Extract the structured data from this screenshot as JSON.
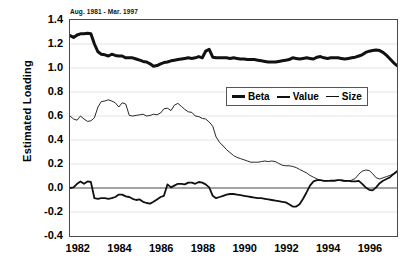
{
  "chart_data": {
    "type": "line",
    "title": "",
    "subtitle": "Aug. 1981 - Mar. 1997",
    "xlabel": "",
    "ylabel": "Estimated Loading",
    "xlim": [
      1981.58,
      1997.25
    ],
    "ylim": [
      -0.4,
      1.4
    ],
    "ytick_labels": [
      "1.4",
      "1.2",
      "1.0",
      "0.8",
      "0.6",
      "0.4",
      "0.2",
      "0.0",
      "-0.2",
      "-0.4"
    ],
    "ytick_values": [
      1.4,
      1.2,
      1.0,
      0.8,
      0.6,
      0.4,
      0.2,
      0.0,
      -0.2,
      -0.4
    ],
    "xtick_labels": [
      "1982",
      "1984",
      "1986",
      "1988",
      "1990",
      "1992",
      "1994",
      "1996"
    ],
    "xtick_values": [
      1982,
      1984,
      1986,
      1988,
      1990,
      1992,
      1994,
      1996
    ],
    "grid": "horizontal",
    "zero_line": true,
    "legend_position": "upper-center",
    "legend": [
      "Beta",
      "Value",
      "Size"
    ],
    "x": [
      1981.58,
      1981.75,
      1981.92,
      1982.08,
      1982.25,
      1982.42,
      1982.58,
      1982.75,
      1982.92,
      1983.08,
      1983.25,
      1983.42,
      1983.58,
      1983.75,
      1983.92,
      1984.08,
      1984.25,
      1984.42,
      1984.58,
      1984.75,
      1984.92,
      1985.08,
      1985.25,
      1985.42,
      1985.58,
      1985.75,
      1985.92,
      1986.08,
      1986.25,
      1986.42,
      1986.58,
      1986.75,
      1986.92,
      1987.08,
      1987.25,
      1987.42,
      1987.58,
      1987.75,
      1987.92,
      1988.08,
      1988.25,
      1988.42,
      1988.58,
      1988.75,
      1988.92,
      1989.08,
      1989.25,
      1989.42,
      1989.58,
      1989.75,
      1989.92,
      1990.08,
      1990.25,
      1990.42,
      1990.58,
      1990.75,
      1990.92,
      1991.08,
      1991.25,
      1991.42,
      1991.58,
      1991.75,
      1991.92,
      1992.08,
      1992.25,
      1992.42,
      1992.58,
      1992.75,
      1992.92,
      1993.08,
      1993.25,
      1993.42,
      1993.58,
      1993.75,
      1993.92,
      1994.08,
      1994.25,
      1994.42,
      1994.58,
      1994.75,
      1994.92,
      1995.08,
      1995.25,
      1995.42,
      1995.58,
      1995.75,
      1995.92,
      1996.08,
      1996.25,
      1996.42,
      1996.58,
      1996.75,
      1996.92,
      1997.08,
      1997.25
    ],
    "series": [
      {
        "name": "Beta",
        "style": "thick",
        "color": "#111111",
        "width": 3.0,
        "values": [
          1.27,
          1.255,
          1.275,
          1.285,
          1.285,
          1.29,
          1.285,
          1.2,
          1.135,
          1.115,
          1.11,
          1.1,
          1.115,
          1.105,
          1.1,
          1.1,
          1.085,
          1.085,
          1.085,
          1.075,
          1.065,
          1.055,
          1.05,
          1.035,
          1.015,
          1.02,
          1.035,
          1.045,
          1.05,
          1.06,
          1.065,
          1.07,
          1.075,
          1.08,
          1.085,
          1.08,
          1.085,
          1.095,
          1.085,
          1.14,
          1.155,
          1.09,
          1.085,
          1.085,
          1.085,
          1.085,
          1.08,
          1.085,
          1.08,
          1.075,
          1.075,
          1.07,
          1.07,
          1.07,
          1.065,
          1.06,
          1.055,
          1.05,
          1.05,
          1.05,
          1.055,
          1.06,
          1.065,
          1.07,
          1.085,
          1.08,
          1.075,
          1.08,
          1.085,
          1.08,
          1.075,
          1.09,
          1.095,
          1.085,
          1.08,
          1.085,
          1.085,
          1.085,
          1.08,
          1.075,
          1.08,
          1.085,
          1.09,
          1.1,
          1.11,
          1.13,
          1.14,
          1.145,
          1.15,
          1.145,
          1.13,
          1.105,
          1.075,
          1.045,
          1.02
        ]
      },
      {
        "name": "Value",
        "style": "medium",
        "color": "#111111",
        "width": 1.8,
        "values": [
          0.0,
          0.005,
          0.035,
          0.055,
          0.035,
          0.055,
          0.05,
          -0.085,
          -0.09,
          -0.085,
          -0.085,
          -0.09,
          -0.085,
          -0.075,
          -0.055,
          -0.055,
          -0.07,
          -0.075,
          -0.09,
          -0.1,
          -0.095,
          -0.115,
          -0.125,
          -0.13,
          -0.115,
          -0.095,
          -0.075,
          -0.065,
          0.03,
          0.005,
          0.02,
          0.035,
          0.035,
          0.03,
          0.045,
          0.045,
          0.035,
          0.05,
          0.045,
          0.03,
          0.005,
          -0.065,
          -0.085,
          -0.075,
          -0.065,
          -0.055,
          -0.05,
          -0.05,
          -0.055,
          -0.06,
          -0.065,
          -0.07,
          -0.075,
          -0.08,
          -0.085,
          -0.085,
          -0.09,
          -0.095,
          -0.1,
          -0.105,
          -0.11,
          -0.115,
          -0.12,
          -0.135,
          -0.155,
          -0.155,
          -0.135,
          -0.09,
          -0.035,
          0.02,
          0.055,
          0.065,
          0.065,
          0.06,
          0.06,
          0.06,
          0.06,
          0.065,
          0.065,
          0.06,
          0.06,
          0.055,
          0.055,
          0.06,
          0.035,
          0.005,
          -0.015,
          -0.02,
          0.005,
          0.04,
          0.06,
          0.075,
          0.09,
          0.115,
          0.14
        ]
      },
      {
        "name": "Size",
        "style": "thin",
        "color": "#111111",
        "width": 0.9,
        "values": [
          0.6,
          0.575,
          0.565,
          0.6,
          0.575,
          0.555,
          0.56,
          0.585,
          0.675,
          0.72,
          0.725,
          0.735,
          0.725,
          0.71,
          0.675,
          0.71,
          0.7,
          0.605,
          0.6,
          0.605,
          0.61,
          0.615,
          0.6,
          0.605,
          0.615,
          0.61,
          0.625,
          0.66,
          0.665,
          0.645,
          0.69,
          0.705,
          0.68,
          0.655,
          0.635,
          0.63,
          0.6,
          0.595,
          0.58,
          0.575,
          0.55,
          0.515,
          0.425,
          0.38,
          0.35,
          0.32,
          0.295,
          0.27,
          0.255,
          0.245,
          0.235,
          0.225,
          0.215,
          0.215,
          0.215,
          0.22,
          0.225,
          0.22,
          0.225,
          0.22,
          0.205,
          0.19,
          0.185,
          0.185,
          0.18,
          0.17,
          0.155,
          0.14,
          0.125,
          0.105,
          0.09,
          0.075,
          0.065,
          0.06,
          0.06,
          0.065,
          0.065,
          0.065,
          0.06,
          0.055,
          0.06,
          0.065,
          0.08,
          0.115,
          0.14,
          0.15,
          0.145,
          0.12,
          0.085,
          0.075,
          0.085,
          0.095,
          0.105,
          0.12,
          0.135
        ]
      }
    ]
  },
  "axis": {
    "y_title": "Estimated Loading"
  },
  "legend": {
    "items": [
      {
        "label": "Beta",
        "swatch": "thick-line-swatch"
      },
      {
        "label": "Value",
        "swatch": "medium-line-swatch"
      },
      {
        "label": "Size",
        "swatch": "thin-line-swatch"
      }
    ]
  },
  "colors": {
    "line": "#111111",
    "frame": "#4a4a4a",
    "grid": "#e4e4e4",
    "zero": "#555555",
    "background": "#ffffff"
  }
}
